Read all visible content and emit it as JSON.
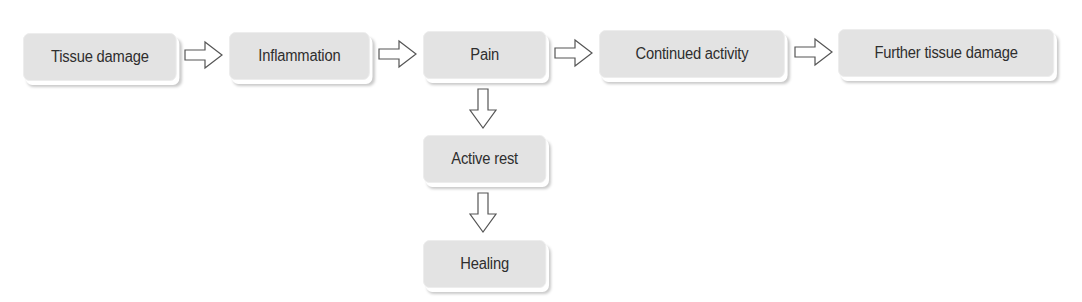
{
  "diagram": {
    "nodes": [
      {
        "id": "tissue-damage",
        "label": "Tissue damage"
      },
      {
        "id": "inflammation",
        "label": "Inflammation"
      },
      {
        "id": "pain",
        "label": "Pain"
      },
      {
        "id": "continued-activity",
        "label": "Continued activity"
      },
      {
        "id": "further-tissue-damage",
        "label": "Further tissue damage"
      },
      {
        "id": "active-rest",
        "label": "Active rest"
      },
      {
        "id": "healing",
        "label": "Healing"
      }
    ],
    "edges": [
      {
        "from": "tissue-damage",
        "to": "inflammation"
      },
      {
        "from": "inflammation",
        "to": "pain"
      },
      {
        "from": "pain",
        "to": "continued-activity"
      },
      {
        "from": "continued-activity",
        "to": "further-tissue-damage"
      },
      {
        "from": "pain",
        "to": "active-rest"
      },
      {
        "from": "active-rest",
        "to": "healing"
      }
    ],
    "colors": {
      "box_fill": "#e3e3e3",
      "text": "#2e2e2e",
      "arrow_stroke": "#555555"
    }
  }
}
